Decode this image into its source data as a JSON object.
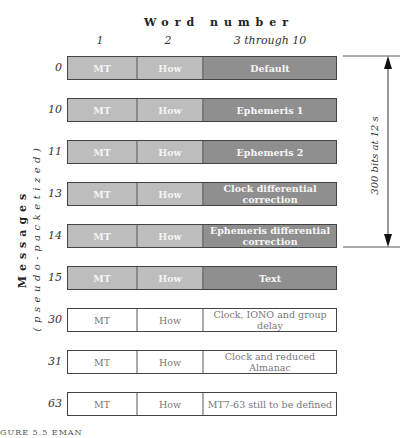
{
  "title": "Word number",
  "column_headers": [
    "1",
    "2",
    "3 through 10"
  ],
  "y_axis": {
    "label": "Messages",
    "sublabel": "(pseudo-packetized)"
  },
  "span_annotation": "300 bits at 12 s",
  "messages": [
    {
      "number": "0",
      "word1": "MT",
      "word2": "How",
      "content": "Default",
      "style": "filled"
    },
    {
      "number": "10",
      "word1": "MT",
      "word2": "How",
      "content": "Ephemeris 1",
      "style": "filled"
    },
    {
      "number": "11",
      "word1": "MT",
      "word2": "How",
      "content": "Ephemeris 2",
      "style": "filled"
    },
    {
      "number": "13",
      "word1": "MT",
      "word2": "How",
      "content": "Clock differential correction",
      "style": "filled"
    },
    {
      "number": "14",
      "word1": "MT",
      "word2": "How",
      "content": "Ephemeris differential correction",
      "style": "filled"
    },
    {
      "number": "15",
      "word1": "MT",
      "word2": "How",
      "content": "Text",
      "style": "filled"
    },
    {
      "number": "30",
      "word1": "MT",
      "word2": "How",
      "content": "Clock, IONO and group delay",
      "style": "empty"
    },
    {
      "number": "31",
      "word1": "MT",
      "word2": "How",
      "content": "Clock and reduced Almanac",
      "style": "empty"
    },
    {
      "number": "63",
      "word1": "MT",
      "word2": "How",
      "content": "MT7-63 still to be defined",
      "style": "empty"
    }
  ],
  "caption": "GURE 5.5   EMAN",
  "colors": {
    "word_fill": "#bdbdbd",
    "content_fill": "#8f8f8f",
    "border": "#444444"
  }
}
